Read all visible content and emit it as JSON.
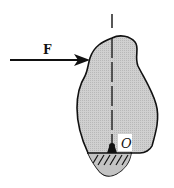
{
  "diagram": {
    "force_label": "F",
    "pivot_label": "O",
    "colors": {
      "body_fill": "#c9c9c9",
      "stroke": "#111111",
      "background": "#ffffff"
    }
  }
}
